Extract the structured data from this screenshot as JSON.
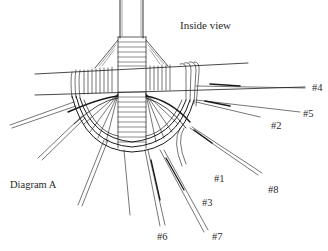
{
  "diagram": {
    "title": "Inside view",
    "caption": "Diagram A",
    "stroke_color": "#1a1a1a",
    "background": "#ffffff",
    "spoke_labels": [
      {
        "id": "4",
        "text": "#4",
        "x": 312,
        "y": 89
      },
      {
        "id": "5",
        "text": "#5",
        "x": 304,
        "y": 115
      },
      {
        "id": "2",
        "text": "#2",
        "x": 272,
        "y": 128
      },
      {
        "id": "1",
        "text": "#1",
        "x": 214,
        "y": 181
      },
      {
        "id": "8",
        "text": "#8",
        "x": 268,
        "y": 190
      },
      {
        "id": "3",
        "text": "#3",
        "x": 202,
        "y": 203
      },
      {
        "id": "6",
        "text": "#6",
        "x": 157,
        "y": 236
      },
      {
        "id": "7",
        "text": "#7",
        "x": 212,
        "y": 236
      }
    ]
  }
}
